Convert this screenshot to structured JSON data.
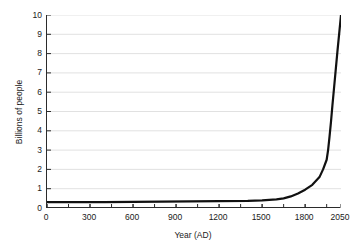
{
  "chart_data": {
    "type": "line",
    "title": "",
    "xlabel": "Year (AD)",
    "ylabel": "Billions of people",
    "xlim": [
      0,
      2050
    ],
    "ylim": [
      0,
      10
    ],
    "grid": "horizontal",
    "legend": "none",
    "line_color": "#111111",
    "grid_color": "#d9d9d9",
    "axis_color": "#2b2b2b",
    "background": "#ffffff",
    "x_ticks_labeled": [
      0,
      300,
      600,
      900,
      1200,
      1500,
      1800,
      2050
    ],
    "x_tick_labels": [
      "0",
      "300",
      "600",
      "900",
      "1200",
      "1500",
      "1800",
      "2050"
    ],
    "x_minor_tick_interval": 150,
    "y_ticks": [
      0,
      1,
      2,
      3,
      4,
      5,
      6,
      7,
      8,
      9,
      10
    ],
    "y_tick_labels": [
      "0",
      "1",
      "2",
      "3",
      "4",
      "5",
      "6",
      "7",
      "8",
      "9",
      "10"
    ],
    "series": [
      {
        "name": "World population",
        "x": [
          0,
          200,
          400,
          600,
          800,
          1000,
          1200,
          1400,
          1500,
          1600,
          1650,
          1700,
          1750,
          1800,
          1850,
          1900,
          1925,
          1950,
          1960,
          1970,
          1980,
          1990,
          2000,
          2010,
          2025,
          2050
        ],
        "y": [
          0.3,
          0.3,
          0.3,
          0.32,
          0.33,
          0.34,
          0.36,
          0.37,
          0.4,
          0.45,
          0.5,
          0.6,
          0.75,
          0.95,
          1.2,
          1.6,
          2.0,
          2.5,
          3.0,
          3.7,
          4.45,
          5.3,
          6.1,
          6.9,
          8.1,
          10.0
        ],
        "color": "#111111",
        "width": 2.2
      }
    ]
  }
}
